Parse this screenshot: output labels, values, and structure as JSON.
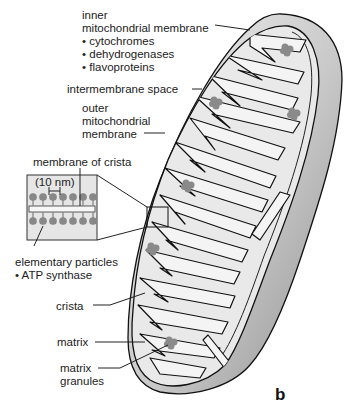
{
  "figure": {
    "panel_label": "b",
    "labels": {
      "inner_membrane": {
        "title_lines": [
          "inner",
          "mitochondrial membrane"
        ],
        "bullets": [
          "cytochromes",
          "dehydrogenases",
          "flavoproteins"
        ]
      },
      "intermembrane_space": "intermembrane space",
      "outer_membrane": [
        "outer",
        "mitochondrial",
        "membrane"
      ],
      "membrane_of_crista": "membrane of crista",
      "scale": "(10 nm)",
      "elementary_particles": {
        "title": "elementary particles",
        "bullets": [
          "ATP synthase"
        ]
      },
      "crista": "crista",
      "matrix": "matrix",
      "matrix_granules": [
        "matrix",
        "granules"
      ]
    },
    "bullet_char": "•",
    "colors": {
      "outline": "#111111",
      "matrix_fill": "#e9e9e9",
      "granule": "#8a8a8a",
      "outer_shadow_light": "#f2f2f2",
      "outer_shadow_dark": "#8f8f8f"
    }
  }
}
